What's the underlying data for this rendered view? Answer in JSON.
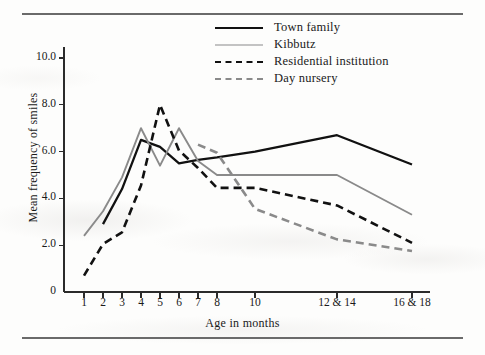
{
  "figure": {
    "axis_color": "#2b2b2b",
    "series_dark_color": "#111111",
    "series_gray_color": "#8a8a8a",
    "rule_color": "#6a6a6a"
  },
  "legend": {
    "position": "top-center-right",
    "items": [
      {
        "label": "Town family",
        "color": "#111111",
        "style": "solid"
      },
      {
        "label": "Kibbutz",
        "color": "#8a8a8a",
        "style": "solid"
      },
      {
        "label": "Residential institution",
        "color": "#111111",
        "style": "dashed"
      },
      {
        "label": "Day nursery",
        "color": "#8a8a8a",
        "style": "dashed"
      }
    ]
  },
  "axes": {
    "y_title": "Mean frequency of smiles",
    "x_title": "Age in months",
    "y_ticks": [
      "0",
      "2.0",
      "4.0",
      "6.0",
      "8.0",
      "10.0"
    ],
    "y_tick_values": [
      0,
      2,
      4,
      6,
      8,
      10
    ],
    "x_ticks": [
      "1",
      "2",
      "3",
      "4",
      "5",
      "6",
      "7",
      "8",
      "10",
      "12 & 14",
      "16 & 18"
    ]
  },
  "chart_data": {
    "type": "line",
    "title": "",
    "xlabel": "Age in months",
    "ylabel": "Mean frequency of smiles",
    "categories": [
      "1",
      "2",
      "3",
      "4",
      "5",
      "6",
      "7",
      "8",
      "10",
      "12 & 14",
      "16 & 18"
    ],
    "x_positions": [
      84,
      103,
      122,
      141,
      160,
      179,
      198,
      217,
      255,
      337,
      412
    ],
    "ylim": [
      0,
      11.2
    ],
    "xlim": [
      64,
      430
    ],
    "grid": false,
    "legend_position": "top-right",
    "series": [
      {
        "name": "Town family",
        "color": "#111111",
        "style": "solid",
        "x": [
          "2",
          "3",
          "4",
          "5",
          "6",
          "7",
          "8",
          "10",
          "12 & 14",
          "16 & 18"
        ],
        "values": [
          2.9,
          4.4,
          6.5,
          6.2,
          5.5,
          5.65,
          5.75,
          6.0,
          6.7,
          5.45
        ]
      },
      {
        "name": "Kibbutz",
        "color": "#8a8a8a",
        "style": "solid",
        "x": [
          "1",
          "2",
          "3",
          "4",
          "5",
          "6",
          "7",
          "8",
          "10",
          "12 & 14",
          "16 & 18"
        ],
        "values": [
          2.4,
          3.45,
          4.9,
          7.0,
          5.4,
          7.0,
          5.6,
          5.0,
          5.0,
          5.0,
          3.3
        ]
      },
      {
        "name": "Residential institution",
        "color": "#111111",
        "style": "dashed",
        "x": [
          "1",
          "2",
          "3",
          "4",
          "5",
          "6",
          "7",
          "8",
          "10",
          "12 & 14",
          "16 & 18"
        ],
        "values": [
          0.7,
          2.05,
          2.55,
          4.55,
          8.0,
          6.05,
          5.3,
          4.45,
          4.45,
          3.7,
          2.1
        ]
      },
      {
        "name": "Day nursery",
        "color": "#8a8a8a",
        "style": "dashed",
        "x": [
          "7",
          "8",
          "10",
          "12 & 14",
          "16 & 18"
        ],
        "values": [
          6.3,
          5.95,
          3.55,
          2.25,
          1.75
        ]
      }
    ]
  }
}
